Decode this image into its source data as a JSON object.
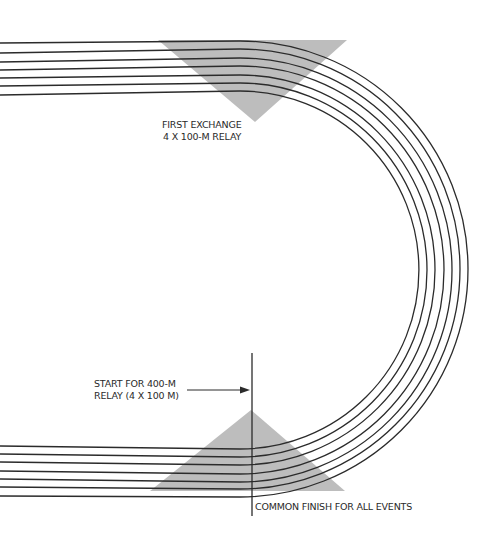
{
  "diagram": {
    "type": "running-track-relay-zones",
    "colors": {
      "lane_line": "#2b2b2b",
      "exchange_zone": "#bdbdbd",
      "background": "#ffffff"
    },
    "lanes": 7,
    "labels": {
      "first_exchange_line1": "FIRST EXCHANGE",
      "first_exchange_line2": "4 X 100-M RELAY",
      "start_line1": "START FOR 400-M",
      "start_line2": "RELAY (4 X 100 M)",
      "finish": "COMMON FINISH FOR ALL EVENTS"
    }
  }
}
